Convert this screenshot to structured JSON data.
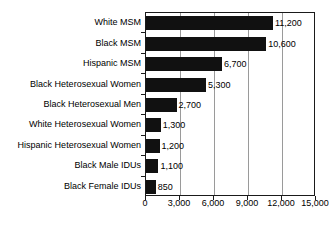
{
  "chart_data": {
    "type": "bar",
    "orientation": "horizontal",
    "title": "",
    "subtitle": "",
    "xlabel": "",
    "ylabel": "",
    "categories": [
      "White MSM",
      "Black MSM",
      "Hispanic MSM",
      "Black Heterosexual Women",
      "Black Heterosexual Men",
      "White Heterosexual Women",
      "Hispanic Heterosexual Women",
      "Black Male IDUs",
      "Black Female IDUs"
    ],
    "values": [
      11200,
      10600,
      6700,
      5300,
      2700,
      1300,
      1200,
      1100,
      850
    ],
    "value_labels": [
      "11,200",
      "10,600",
      "6,700",
      "5,300",
      "2,700",
      "1,300",
      "1,200",
      "1,100",
      "850"
    ],
    "xlim": [
      0,
      15000
    ],
    "xticks": [
      0,
      3000,
      6000,
      9000,
      12000,
      15000
    ],
    "xtick_labels": [
      "0",
      "3,000",
      "6,000",
      "9,000",
      "12,000",
      "15,000"
    ],
    "grid": true,
    "grid_axis": "x",
    "legend": null,
    "bar_color": "#111111",
    "grid_color": "#9a9a9a",
    "axis_color": "#1a1a1a",
    "background_color": "#ffffff",
    "text_color": "#000000"
  }
}
